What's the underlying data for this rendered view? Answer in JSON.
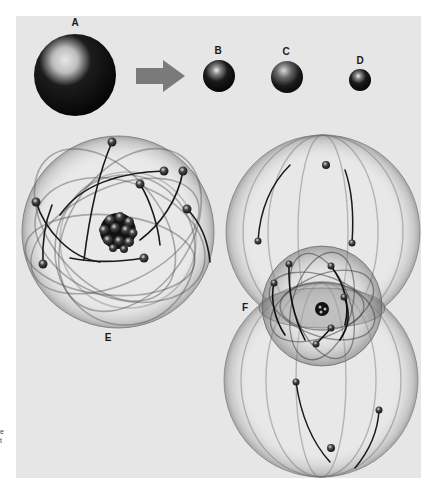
{
  "figure": {
    "background": "#e6e6e6",
    "panel": {
      "x": 16,
      "y": 16,
      "w": 405,
      "h": 462
    },
    "labels": {
      "a": "A",
      "b": "B",
      "c": "C",
      "d": "D",
      "e": "E",
      "f": "F"
    },
    "spheres": {
      "a": {
        "cx": 75,
        "cy": 75,
        "r": 41
      },
      "b": {
        "cx": 219,
        "cy": 76,
        "r": 16
      },
      "c": {
        "cx": 287,
        "cy": 77,
        "r": 16
      },
      "d": {
        "cx": 360,
        "cy": 80,
        "r": 11
      }
    },
    "arrow": {
      "direction": "right",
      "color": "#7a7a7a"
    },
    "atom_e": {
      "center": [
        118,
        232
      ],
      "outer_radius": 96,
      "nucleus_particles": 12,
      "electrons": [
        [
          112,
          142
        ],
        [
          164,
          171
        ],
        [
          183,
          171
        ],
        [
          140,
          184
        ],
        [
          187,
          209
        ],
        [
          36,
          202
        ],
        [
          43,
          264
        ],
        [
          144,
          258
        ]
      ]
    },
    "atom_f": {
      "center": [
        322,
        308
      ],
      "upper_lobe": {
        "cx": 323,
        "cy": 232,
        "r": 97
      },
      "lower_lobe": {
        "cx": 321,
        "cy": 380,
        "r": 97
      },
      "inner_radius": 60,
      "electrons_upper": [
        [
          326,
          165
        ],
        [
          258,
          241
        ],
        [
          352,
          243
        ]
      ],
      "electrons_inner": [
        [
          289,
          264
        ],
        [
          331,
          266
        ],
        [
          274,
          283
        ],
        [
          344,
          297
        ],
        [
          331,
          328
        ],
        [
          316,
          344
        ]
      ],
      "electrons_lower": [
        [
          296,
          382
        ],
        [
          379,
          410
        ],
        [
          331,
          448
        ]
      ]
    },
    "side_marks": [
      "e",
      "t"
    ]
  }
}
